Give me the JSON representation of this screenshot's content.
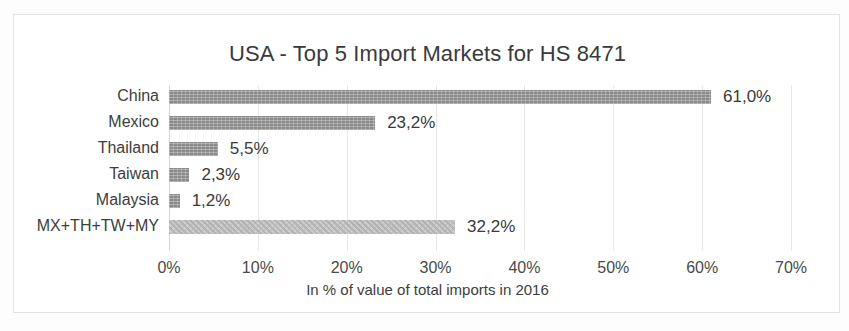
{
  "chart_data": {
    "type": "bar",
    "orientation": "horizontal",
    "title": "USA - Top 5 Import Markets for HS 8471",
    "xlabel": "In % of value of total imports in 2016",
    "ylabel": "",
    "categories": [
      "China",
      "Mexico",
      "Thailand",
      "Taiwan",
      "Malaysia",
      "MX+TH+TW+MY"
    ],
    "values": [
      61.0,
      23.2,
      5.5,
      2.3,
      1.2,
      32.2
    ],
    "data_labels": [
      "61,0%",
      "23,2%",
      "5,5%",
      "2,3%",
      "1,2%",
      "32,2%"
    ],
    "xlim": [
      0,
      70
    ],
    "xticks": [
      0,
      10,
      20,
      30,
      40,
      50,
      60,
      70
    ],
    "xtick_labels": [
      "0%",
      "10%",
      "20%",
      "30%",
      "40%",
      "50%",
      "60%",
      "70%"
    ],
    "grid": true,
    "legend": false,
    "series": [
      {
        "name": "Share of total imports",
        "values": [
          61.0,
          23.2,
          5.5,
          2.3,
          1.2,
          32.2
        ]
      }
    ],
    "bar_styles": [
      "solid",
      "solid",
      "solid",
      "solid",
      "solid",
      "checker"
    ],
    "colors": {
      "bar": "#8a8a8a",
      "bar_aggregate": "#cfcfcf",
      "grid": "#e8e8e8",
      "axis": "#d6d6d6",
      "text": "#3a3a3a",
      "frame": "#e3e3e3",
      "background": "#ffffff"
    }
  }
}
